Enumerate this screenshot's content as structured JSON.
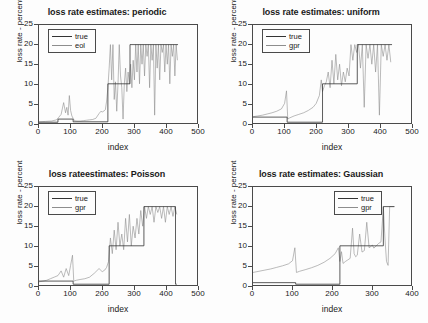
{
  "figure": {
    "background": "#fdfdfd",
    "axis_color": "#4a4a4a",
    "true_color": "#333333",
    "estimate_color": "#8d8d8d"
  },
  "chart_data": [
    {
      "type": "line",
      "title": "loss rate estimates: periodic",
      "xlabel": "index",
      "ylabel": "loss rate - percent",
      "xlim": [
        0,
        500
      ],
      "ylim": [
        0,
        25
      ],
      "xticks": [
        0,
        100,
        200,
        300,
        400,
        500
      ],
      "yticks": [
        0,
        5,
        10,
        15,
        20,
        25
      ],
      "grid": false,
      "legend_position": "upper-left",
      "legend": [
        "true",
        "eol"
      ],
      "series": [
        {
          "name": "true",
          "color": "#333333",
          "description": "piecewise-constant step function",
          "x": [
            0,
            60,
            60,
            108,
            108,
            218,
            218,
            288,
            288,
            440
          ],
          "values": [
            0.2,
            0.2,
            1.0,
            1.0,
            0.3,
            0.3,
            10.0,
            10.0,
            20.0,
            20.0
          ]
        },
        {
          "name": "eol",
          "color": "#8d8d8d",
          "description": "noisy loss-rate estimate oscillating about the true step levels, saturating at 20 percent after index 300",
          "x": [
            0,
            20,
            40,
            55,
            62,
            70,
            78,
            84,
            88,
            92,
            96,
            100,
            104,
            108,
            112,
            120,
            130,
            140,
            150,
            160,
            170,
            180,
            190,
            196,
            200,
            206,
            210,
            214,
            218,
            222,
            226,
            230,
            234,
            238,
            242,
            246,
            250,
            254,
            258,
            262,
            266,
            270,
            274,
            278,
            282,
            286,
            290,
            294,
            298,
            302,
            306,
            310,
            314,
            318,
            322,
            326,
            330,
            334,
            338,
            342,
            346,
            350,
            354,
            358,
            362,
            366,
            370,
            374,
            378,
            382,
            386,
            390,
            394,
            398,
            402,
            406,
            410,
            414,
            418,
            422,
            426,
            430,
            434,
            438
          ],
          "values": [
            0.3,
            0.4,
            0.5,
            0.8,
            1.4,
            2.2,
            5.2,
            2.6,
            4.0,
            2.0,
            7.0,
            3.2,
            1.8,
            1.2,
            0.6,
            0.5,
            0.5,
            0.6,
            0.7,
            0.8,
            0.9,
            1.2,
            2.4,
            3.0,
            2.8,
            3.1,
            3.4,
            5.6,
            9.0,
            14.0,
            20.0,
            11.0,
            20.0,
            6.0,
            10.5,
            3.0,
            10.0,
            20.0,
            12.0,
            9.0,
            1.0,
            10.0,
            14.0,
            8.0,
            13.0,
            10.0,
            15.0,
            9.0,
            16.0,
            11.0,
            20.0,
            13.0,
            20.0,
            10.0,
            20.0,
            15.0,
            20.0,
            12.0,
            20.0,
            17.0,
            20.0,
            9.0,
            20.0,
            16.0,
            20.0,
            2.0,
            20.0,
            14.0,
            20.0,
            11.0,
            20.0,
            18.0,
            20.0,
            13.0,
            20.0,
            15.0,
            20.0,
            10.0,
            20.0,
            17.0,
            20.0,
            12.0,
            20.0,
            16.0
          ]
        }
      ]
    },
    {
      "type": "line",
      "title": "loss rate estimates: uniform",
      "xlabel": "index",
      "ylabel": "loss rate - percent",
      "xlim": [
        0,
        500
      ],
      "ylim": [
        0,
        25
      ],
      "xticks": [
        0,
        100,
        200,
        300,
        400,
        500
      ],
      "yticks": [
        0,
        5,
        10,
        15,
        20,
        25
      ],
      "grid": false,
      "legend_position": "upper-left",
      "legend": [
        "true",
        "gpr"
      ],
      "series": [
        {
          "name": "true",
          "color": "#333333",
          "description": "piecewise-constant step function with drop at 108 and rises at 220 and 330",
          "x": [
            0,
            108,
            108,
            220,
            220,
            330,
            330,
            440
          ],
          "values": [
            1.5,
            1.5,
            0.2,
            0.2,
            10.0,
            10.0,
            20.0,
            20.0
          ]
        },
        {
          "name": "gpr",
          "color": "#8d8d8d",
          "description": "gaussian process regression estimate: slow ramps with sawtooth resets then heavy oscillation saturating near 20",
          "x": [
            0,
            15,
            30,
            45,
            60,
            75,
            90,
            100,
            106,
            110,
            116,
            130,
            145,
            160,
            175,
            190,
            200,
            210,
            216,
            220,
            226,
            232,
            238,
            244,
            250,
            256,
            262,
            268,
            274,
            280,
            286,
            292,
            298,
            304,
            310,
            316,
            322,
            328,
            334,
            340,
            346,
            352,
            358,
            364,
            370,
            376,
            382,
            388,
            394,
            400,
            406,
            412,
            418,
            424,
            430,
            436
          ],
          "values": [
            1.6,
            1.8,
            2.0,
            2.3,
            2.6,
            3.0,
            3.6,
            5.0,
            8.2,
            1.0,
            1.3,
            1.8,
            2.2,
            2.6,
            3.2,
            4.0,
            5.0,
            7.0,
            11.0,
            8.0,
            9.5,
            10.5,
            13.0,
            9.0,
            16.0,
            10.0,
            17.5,
            11.0,
            15.0,
            9.5,
            13.0,
            10.5,
            14.0,
            12.0,
            20.0,
            16.0,
            20.0,
            18.0,
            20.0,
            14.0,
            20.0,
            4.0,
            20.0,
            16.5,
            20.0,
            15.0,
            20.0,
            13.0,
            20.0,
            2.0,
            20.0,
            17.0,
            20.0,
            16.0,
            20.0,
            15.5
          ]
        }
      ]
    },
    {
      "type": "line",
      "title": "loss rateestimates: Poisson",
      "xlabel": "index",
      "ylabel": "loss rate - percent",
      "xlim": [
        0,
        500
      ],
      "ylim": [
        0,
        25
      ],
      "xticks": [
        0,
        100,
        200,
        300,
        400,
        500
      ],
      "yticks": [
        0,
        5,
        10,
        15,
        20,
        25
      ],
      "grid": false,
      "legend_position": "upper-left",
      "legend": [
        "true",
        "gpr"
      ],
      "series": [
        {
          "name": "true",
          "color": "#333333",
          "description": "step function rising to 10 at index 222 and to 20 at index 332, dropping to 0 at 432",
          "x": [
            0,
            108,
            108,
            222,
            222,
            332,
            332,
            432,
            432,
            436
          ],
          "values": [
            1.0,
            1.0,
            0.2,
            0.2,
            10.0,
            10.0,
            20.0,
            20.0,
            0.2,
            0.2
          ]
        },
        {
          "name": "gpr",
          "color": "#8d8d8d",
          "description": "noisy estimate with small spikes before 110 and large oscillation between 10 and 20 after 220",
          "x": [
            0,
            12,
            24,
            36,
            48,
            60,
            70,
            78,
            86,
            94,
            100,
            106,
            110,
            118,
            130,
            145,
            160,
            175,
            190,
            200,
            208,
            214,
            220,
            226,
            232,
            238,
            244,
            250,
            256,
            262,
            268,
            274,
            280,
            286,
            292,
            298,
            304,
            310,
            316,
            322,
            328,
            334,
            340,
            346,
            352,
            358,
            364,
            370,
            376,
            382,
            388,
            394,
            400,
            406,
            412,
            418,
            424,
            430,
            436
          ],
          "values": [
            0.8,
            1.0,
            1.2,
            1.6,
            2.0,
            2.4,
            3.6,
            2.0,
            4.2,
            2.4,
            5.0,
            7.6,
            1.0,
            1.2,
            1.4,
            1.6,
            2.0,
            3.0,
            4.2,
            3.4,
            3.8,
            4.5,
            6.0,
            12.0,
            8.0,
            14.0,
            9.0,
            16.0,
            10.0,
            13.0,
            9.0,
            17.0,
            11.0,
            18.0,
            10.0,
            15.0,
            12.0,
            17.0,
            13.0,
            19.0,
            15.0,
            20.0,
            17.0,
            20.0,
            18.0,
            20.0,
            16.0,
            20.0,
            18.5,
            20.0,
            17.0,
            20.0,
            16.0,
            20.0,
            18.0,
            20.0,
            17.5,
            20.0,
            18.0
          ]
        }
      ]
    },
    {
      "type": "line",
      "title": "loss rate estimates: Gaussian",
      "xlabel": "index",
      "ylabel": "loss rate - percent",
      "xlim": [
        0,
        400
      ],
      "ylim": [
        0,
        25
      ],
      "xticks": [
        0,
        100,
        200,
        300,
        400
      ],
      "yticks": [
        0,
        5,
        10,
        15,
        20,
        25
      ],
      "grid": false,
      "legend_position": "upper-center",
      "legend": [
        "true",
        "gpr"
      ],
      "series": [
        {
          "name": "true",
          "color": "#333333",
          "description": "step function: 0.2 until 220, then 10 until 330, then 20 until 358",
          "x": [
            0,
            108,
            108,
            220,
            220,
            330,
            330,
            358
          ],
          "values": [
            0.6,
            0.6,
            0.2,
            0.2,
            10.0,
            10.0,
            20.0,
            20.0
          ]
        },
        {
          "name": "gpr",
          "color": "#8d8d8d",
          "description": "smooth ramp with sawtooth reset at 110 and isolated narrow spikes to 14-20 after index 250",
          "x": [
            0,
            15,
            30,
            45,
            60,
            75,
            90,
            100,
            106,
            110,
            118,
            132,
            148,
            164,
            180,
            195,
            208,
            216,
            220,
            224,
            228,
            234,
            240,
            246,
            252,
            256,
            260,
            264,
            270,
            276,
            282,
            288,
            294,
            298,
            302,
            306,
            312,
            318,
            324,
            330,
            334,
            338,
            342,
            346,
            350,
            354,
            358
          ],
          "values": [
            3.2,
            3.5,
            3.8,
            4.1,
            4.5,
            4.9,
            5.4,
            6.2,
            9.5,
            3.2,
            3.5,
            3.9,
            4.4,
            5.0,
            5.8,
            6.8,
            8.0,
            9.5,
            6.0,
            8.5,
            5.5,
            6.0,
            6.4,
            6.8,
            14.5,
            8.0,
            7.2,
            7.6,
            13.0,
            8.4,
            8.8,
            16.0,
            9.5,
            9.8,
            10.2,
            9.4,
            10.0,
            10.6,
            11.0,
            20.0,
            12.0,
            6.0,
            5.0,
            20.0,
            20.0,
            20.0,
            20.0
          ]
        }
      ]
    }
  ]
}
